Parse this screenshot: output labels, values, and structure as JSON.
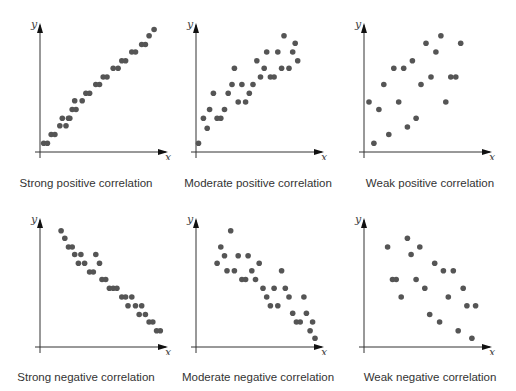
{
  "figure": {
    "panels": [
      {
        "id": "strong-positive",
        "caption": "Strong positive correlation"
      },
      {
        "id": "moderate-positive",
        "caption": "Moderate positive correlation"
      },
      {
        "id": "weak-positive",
        "caption": "Weak positive correlation"
      },
      {
        "id": "strong-negative",
        "caption": "Strong negative correlation"
      },
      {
        "id": "moderate-negative",
        "caption": "Moderate negative correlation"
      },
      {
        "id": "weak-negative",
        "caption": "Weak negative correlation"
      }
    ],
    "axis_labels": {
      "x": "x",
      "y": "y"
    },
    "colors": {
      "point": "#555555",
      "axis": "#333333",
      "text": "#333333"
    }
  },
  "chart_data": [
    {
      "type": "scatter",
      "title": "Strong positive correlation",
      "xlabel": "x",
      "ylabel": "y",
      "xlim": [
        0,
        100
      ],
      "ylim": [
        0,
        100
      ],
      "grid": false,
      "points": [
        [
          3,
          7
        ],
        [
          6,
          7
        ],
        [
          9,
          14
        ],
        [
          12,
          14
        ],
        [
          16,
          21
        ],
        [
          21,
          21
        ],
        [
          18,
          27
        ],
        [
          23,
          27
        ],
        [
          26,
          34
        ],
        [
          29,
          34
        ],
        [
          24,
          27
        ],
        [
          28,
          41
        ],
        [
          34,
          41
        ],
        [
          37,
          47
        ],
        [
          40,
          47
        ],
        [
          45,
          54
        ],
        [
          48,
          54
        ],
        [
          51,
          60
        ],
        [
          54,
          60
        ],
        [
          59,
          67
        ],
        [
          63,
          67
        ],
        [
          66,
          73
        ],
        [
          69,
          73
        ],
        [
          74,
          80
        ],
        [
          77,
          80
        ],
        [
          82,
          86
        ],
        [
          85,
          86
        ],
        [
          88,
          93
        ],
        [
          92,
          98
        ]
      ]
    },
    {
      "type": "scatter",
      "title": "Moderate positive correlation",
      "xlabel": "x",
      "ylabel": "y",
      "xlim": [
        0,
        100
      ],
      "ylim": [
        0,
        100
      ],
      "grid": false,
      "points": [
        [
          2,
          7
        ],
        [
          6,
          27
        ],
        [
          9,
          19
        ],
        [
          11,
          34
        ],
        [
          14,
          47
        ],
        [
          17,
          27
        ],
        [
          20,
          27
        ],
        [
          23,
          34
        ],
        [
          26,
          47
        ],
        [
          29,
          54
        ],
        [
          31,
          67
        ],
        [
          34,
          40
        ],
        [
          37,
          54
        ],
        [
          40,
          40
        ],
        [
          43,
          47
        ],
        [
          46,
          54
        ],
        [
          49,
          73
        ],
        [
          52,
          60
        ],
        [
          55,
          67
        ],
        [
          57,
          80
        ],
        [
          60,
          60
        ],
        [
          63,
          60
        ],
        [
          66,
          80
        ],
        [
          69,
          67
        ],
        [
          71,
          93
        ],
        [
          75,
          67
        ],
        [
          78,
          80
        ],
        [
          80,
          87
        ],
        [
          82,
          73
        ]
      ]
    },
    {
      "type": "scatter",
      "title": "Weak positive correlation",
      "xlabel": "x",
      "ylabel": "y",
      "xlim": [
        0,
        100
      ],
      "ylim": [
        0,
        100
      ],
      "grid": false,
      "points": [
        [
          4,
          40
        ],
        [
          8,
          7
        ],
        [
          12,
          34
        ],
        [
          16,
          54
        ],
        [
          20,
          14
        ],
        [
          24,
          67
        ],
        [
          28,
          40
        ],
        [
          32,
          67
        ],
        [
          35,
          20
        ],
        [
          39,
          73
        ],
        [
          42,
          27
        ],
        [
          46,
          54
        ],
        [
          50,
          87
        ],
        [
          54,
          60
        ],
        [
          58,
          80
        ],
        [
          62,
          93
        ],
        [
          66,
          40
        ],
        [
          70,
          60
        ],
        [
          74,
          60
        ],
        [
          78,
          87
        ]
      ]
    },
    {
      "type": "scatter",
      "title": "Strong negative correlation",
      "xlabel": "x",
      "ylabel": "y",
      "xlim": [
        0,
        100
      ],
      "ylim": [
        0,
        100
      ],
      "grid": false,
      "points": [
        [
          17,
          93
        ],
        [
          20,
          87
        ],
        [
          23,
          80
        ],
        [
          26,
          80
        ],
        [
          28,
          74
        ],
        [
          33,
          74
        ],
        [
          31,
          67
        ],
        [
          36,
          67
        ],
        [
          40,
          60
        ],
        [
          43,
          60
        ],
        [
          45,
          74
        ],
        [
          48,
          67
        ],
        [
          50,
          54
        ],
        [
          53,
          54
        ],
        [
          56,
          47
        ],
        [
          59,
          47
        ],
        [
          62,
          47
        ],
        [
          66,
          40
        ],
        [
          69,
          40
        ],
        [
          74,
          40
        ],
        [
          71,
          33
        ],
        [
          77,
          33
        ],
        [
          82,
          33
        ],
        [
          80,
          26
        ],
        [
          85,
          26
        ],
        [
          88,
          20
        ],
        [
          91,
          20
        ],
        [
          94,
          13
        ],
        [
          97,
          13
        ]
      ]
    },
    {
      "type": "scatter",
      "title": "Moderate negative correlation",
      "xlabel": "x",
      "ylabel": "y",
      "xlim": [
        0,
        100
      ],
      "ylim": [
        0,
        100
      ],
      "grid": false,
      "points": [
        [
          17,
          67
        ],
        [
          20,
          80
        ],
        [
          23,
          73
        ],
        [
          25,
          61
        ],
        [
          28,
          93
        ],
        [
          31,
          61
        ],
        [
          34,
          73
        ],
        [
          37,
          54
        ],
        [
          40,
          54
        ],
        [
          42,
          73
        ],
        [
          45,
          61
        ],
        [
          48,
          54
        ],
        [
          51,
          67
        ],
        [
          54,
          47
        ],
        [
          57,
          40
        ],
        [
          60,
          33
        ],
        [
          63,
          47
        ],
        [
          66,
          33
        ],
        [
          69,
          61
        ],
        [
          72,
          47
        ],
        [
          75,
          40
        ],
        [
          78,
          27
        ],
        [
          81,
          20
        ],
        [
          84,
          20
        ],
        [
          87,
          40
        ],
        [
          89,
          27
        ],
        [
          92,
          13
        ],
        [
          94,
          20
        ],
        [
          96,
          7
        ]
      ]
    },
    {
      "type": "scatter",
      "title": "Weak negative correlation",
      "xlabel": "x",
      "ylabel": "y",
      "xlim": [
        0,
        100
      ],
      "ylim": [
        0,
        100
      ],
      "grid": false,
      "points": [
        [
          19,
          80
        ],
        [
          23,
          54
        ],
        [
          26,
          54
        ],
        [
          30,
          40
        ],
        [
          35,
          87
        ],
        [
          38,
          74
        ],
        [
          42,
          54
        ],
        [
          45,
          80
        ],
        [
          49,
          47
        ],
        [
          53,
          26
        ],
        [
          57,
          67
        ],
        [
          61,
          20
        ],
        [
          64,
          61
        ],
        [
          68,
          40
        ],
        [
          72,
          61
        ],
        [
          76,
          13
        ],
        [
          80,
          47
        ],
        [
          83,
          33
        ],
        [
          87,
          7
        ],
        [
          90,
          33
        ]
      ]
    }
  ]
}
